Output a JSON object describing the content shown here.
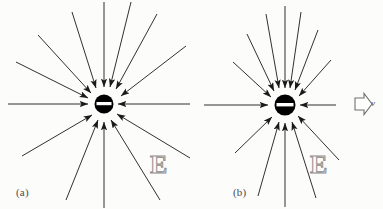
{
  "figure": {
    "background_color": "#fcfcfb",
    "line_color": "#1a1a1a",
    "charge_fill": "#000000",
    "charge_bar_color": "#ffffff",
    "label_outline_color": "#8d8d8d",
    "width": 383,
    "height": 209
  },
  "panels": [
    {
      "id": "a",
      "caption": "(a)",
      "field_label": "E",
      "charge": {
        "sign": "negative",
        "symbol": "minus-bar",
        "center_x": 104,
        "center_y": 104,
        "radius": 9.5
      },
      "field_line_count": 12,
      "field_direction": "inward",
      "field_line_angles_deg": [
        0,
        30,
        55,
        72,
        90,
        108,
        128,
        152,
        180,
        218,
        252,
        302
      ],
      "field_line_length": 115,
      "velocity_arrow": null
    },
    {
      "id": "b",
      "caption": "(b)",
      "field_label": "E",
      "charge": {
        "sign": "negative",
        "symbol": "minus-bar",
        "center_x": 285,
        "center_y": 105,
        "radius": 10.5
      },
      "field_line_count": 12,
      "field_direction": "inward",
      "field_line_angles_deg": [
        0,
        28,
        52,
        70,
        90,
        110,
        130,
        152,
        180,
        235,
        270,
        305
      ],
      "field_line_length": 92,
      "velocity_arrow": {
        "label": "v",
        "direction": "right",
        "style": "hollow-block-arrow",
        "x": 345,
        "y": 104
      }
    }
  ]
}
